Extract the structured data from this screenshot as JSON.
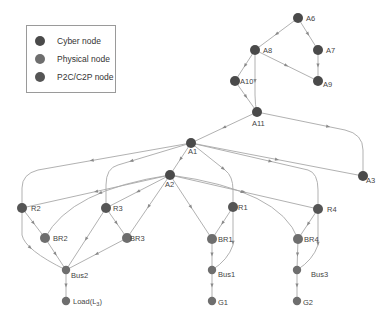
{
  "legend": {
    "items": [
      {
        "label": "Cyber node",
        "color": "#4a4a4a"
      },
      {
        "label": "Physical node",
        "color": "#6e6e6e"
      },
      {
        "label": "P2C/C2P node",
        "color": "#555555"
      }
    ]
  },
  "colors": {
    "edge": "#a8a8a8",
    "arrow": "#8a8a8a",
    "cyber": "#4a4a4a",
    "physical": "#6e6e6e",
    "p2c": "#555555"
  },
  "nodes": [
    {
      "id": "A6",
      "label": "A6",
      "x": 298,
      "y": 18,
      "type": "cyber",
      "lx": 8,
      "ly": 3
    },
    {
      "id": "A8",
      "label": "A8",
      "x": 255,
      "y": 50,
      "type": "cyber",
      "lx": 8,
      "ly": 3
    },
    {
      "id": "A7",
      "label": "A7",
      "x": 318,
      "y": 50,
      "type": "cyber",
      "lx": 8,
      "ly": 3
    },
    {
      "id": "A10",
      "label": "A10",
      "x": 235,
      "y": 81,
      "type": "cyber",
      "lx": 5,
      "ly": 3
    },
    {
      "id": "A9",
      "label": "A9",
      "x": 318,
      "y": 81,
      "type": "cyber",
      "lx": 5,
      "ly": 6
    },
    {
      "id": "A11",
      "label": "A11",
      "x": 257,
      "y": 112,
      "type": "cyber",
      "lx": -5,
      "ly": 14
    },
    {
      "id": "A1",
      "label": "A1",
      "x": 191,
      "y": 143,
      "type": "cyber",
      "lx": -3,
      "ly": 11
    },
    {
      "id": "A3",
      "label": "A3",
      "x": 363,
      "y": 176,
      "type": "cyber",
      "lx": 3,
      "ly": 7
    },
    {
      "id": "A2",
      "label": "A2",
      "x": 170,
      "y": 175,
      "type": "cyber",
      "lx": -5,
      "ly": 12
    },
    {
      "id": "R2",
      "label": "R2",
      "x": 22,
      "y": 208,
      "type": "p2c",
      "lx": 9,
      "ly": 3
    },
    {
      "id": "R3",
      "label": "R3",
      "x": 106,
      "y": 208,
      "type": "p2c",
      "lx": 7,
      "ly": 3
    },
    {
      "id": "R1",
      "label": "R1",
      "x": 233,
      "y": 207,
      "type": "p2c",
      "lx": 5,
      "ly": 3
    },
    {
      "id": "R4",
      "label": "R4",
      "x": 318,
      "y": 209,
      "type": "p2c",
      "lx": 9,
      "ly": 3
    },
    {
      "id": "BR2",
      "label": "BR2",
      "x": 45,
      "y": 238,
      "type": "physical",
      "lx": 8,
      "ly": 3
    },
    {
      "id": "BR3",
      "label": "BR3",
      "x": 127,
      "y": 238,
      "type": "physical",
      "lx": 3,
      "ly": 3
    },
    {
      "id": "BR1",
      "label": "BR1",
      "x": 212,
      "y": 239,
      "type": "physical",
      "lx": 6,
      "ly": 3
    },
    {
      "id": "BR4",
      "label": "BR4",
      "x": 298,
      "y": 239,
      "type": "physical",
      "lx": 6,
      "ly": 3
    },
    {
      "id": "Bus2",
      "label": "Bus2",
      "x": 66,
      "y": 270,
      "type": "physical",
      "lx": 5,
      "ly": 8
    },
    {
      "id": "Bus1",
      "label": "Bus1",
      "x": 212,
      "y": 270,
      "type": "physical",
      "lx": 6,
      "ly": 7
    },
    {
      "id": "Bus3",
      "label": "Bus3",
      "x": 297,
      "y": 270,
      "type": "physical",
      "lx": 14,
      "ly": 7
    },
    {
      "id": "Load",
      "label": "Load(L",
      "sub": "3",
      "x": 66,
      "y": 301,
      "type": "physical",
      "lx": 7,
      "ly": 3
    },
    {
      "id": "G1",
      "label": "G1",
      "x": 212,
      "y": 301,
      "type": "physical",
      "lx": 6,
      "ly": 4
    },
    {
      "id": "G2",
      "label": "G2",
      "x": 297,
      "y": 301,
      "type": "physical",
      "lx": 6,
      "ly": 4
    }
  ],
  "edges": [
    {
      "d": "M298,18 L255,50"
    },
    {
      "d": "M298,18 L318,50"
    },
    {
      "d": "M318,50 L318,81"
    },
    {
      "d": "M255,50 L318,81"
    },
    {
      "d": "M255,50 L235,81"
    },
    {
      "d": "M255,50 L255,95 Q255,105 257,112"
    },
    {
      "d": "M235,81 L257,112"
    },
    {
      "d": "M257,112 L191,143"
    },
    {
      "d": "M257,112 L345,130 Q363,134 363,150 L363,176"
    },
    {
      "d": "M191,143 L363,176"
    },
    {
      "d": "M191,143 L170,175"
    },
    {
      "d": "M191,143 L38,170 Q22,174 22,188 L22,208"
    },
    {
      "d": "M191,143 L118,165 Q106,168 106,185 L106,208"
    },
    {
      "d": "M191,143 L225,170 Q233,176 233,190 L233,207"
    },
    {
      "d": "M191,143 L308,170 Q318,173 318,190 L318,209"
    },
    {
      "d": "M170,175 L22,208"
    },
    {
      "d": "M170,175 L106,208"
    },
    {
      "d": "M170,175 L212,239"
    },
    {
      "d": "M170,175 L318,209"
    },
    {
      "d": "M170,175 Q70,190 45,238"
    },
    {
      "d": "M170,175 Q280,190 298,239"
    },
    {
      "d": "M170,175 L127,238"
    },
    {
      "d": "M22,208 L45,238"
    },
    {
      "d": "M22,208 L22,235 Q25,250 66,270"
    },
    {
      "d": "M106,208 L127,238"
    },
    {
      "d": "M106,208 L66,270"
    },
    {
      "d": "M233,207 L212,239"
    },
    {
      "d": "M233,207 L233,245 Q228,260 212,270"
    },
    {
      "d": "M318,209 L298,239"
    },
    {
      "d": "M318,209 L318,245 Q313,260 297,270"
    },
    {
      "d": "M45,238 L66,270"
    },
    {
      "d": "M127,238 L66,270"
    },
    {
      "d": "M212,239 L212,270"
    },
    {
      "d": "M298,239 L297,270"
    },
    {
      "d": "M66,270 L66,301"
    },
    {
      "d": "M212,270 L212,301"
    },
    {
      "d": "M297,270 L297,301"
    }
  ]
}
